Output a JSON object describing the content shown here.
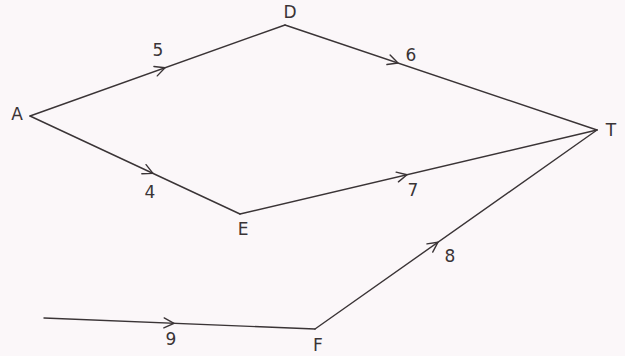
{
  "diagram": {
    "type": "directed-weighted-graph",
    "colors": {
      "background": "#fbf7f9",
      "stroke": "#3a3436",
      "text": "#3a3436"
    },
    "nodes": [
      {
        "id": "A",
        "label": "A",
        "x": 30,
        "y": 116,
        "label_x": 17,
        "label_y": 114
      },
      {
        "id": "D",
        "label": "D",
        "x": 285,
        "y": 25,
        "label_x": 290,
        "label_y": 12
      },
      {
        "id": "E",
        "label": "E",
        "x": 240,
        "y": 214,
        "label_x": 243,
        "label_y": 229
      },
      {
        "id": "F",
        "label": "F",
        "x": 315,
        "y": 329,
        "label_x": 318,
        "label_y": 345
      },
      {
        "id": "T",
        "label": "T",
        "x": 597,
        "y": 130,
        "label_x": 611,
        "label_y": 130
      }
    ],
    "edges": [
      {
        "from": "A",
        "to": "D",
        "weight": "5",
        "x1": 30,
        "y1": 116,
        "x2": 285,
        "y2": 25,
        "arrow_x": 165,
        "arrow_y": 67.8,
        "label_x": 158,
        "label_y": 50
      },
      {
        "from": "D",
        "to": "T",
        "weight": "6",
        "x1": 285,
        "y1": 25,
        "x2": 597,
        "y2": 130,
        "arrow_x": 398,
        "arrow_y": 63,
        "label_x": 411,
        "label_y": 55
      },
      {
        "from": "A",
        "to": "E",
        "weight": "4",
        "x1": 30,
        "y1": 116,
        "x2": 240,
        "y2": 214,
        "arrow_x": 153,
        "arrow_y": 173.4,
        "label_x": 150,
        "label_y": 192
      },
      {
        "from": "E",
        "to": "T",
        "weight": "7",
        "x1": 240,
        "y1": 214,
        "x2": 597,
        "y2": 130,
        "arrow_x": 407,
        "arrow_y": 174.7,
        "label_x": 413,
        "label_y": 190
      },
      {
        "from": "F",
        "to": "T",
        "weight": "8",
        "x1": 315,
        "y1": 329,
        "x2": 597,
        "y2": 130,
        "arrow_x": 438,
        "arrow_y": 242.2,
        "label_x": 450,
        "label_y": 256
      },
      {
        "from": "",
        "to": "F",
        "weight": "9",
        "x1": 44,
        "y1": 318,
        "x2": 315,
        "y2": 329,
        "arrow_x": 174,
        "arrow_y": 323.3,
        "label_x": 171,
        "label_y": 339
      }
    ]
  }
}
